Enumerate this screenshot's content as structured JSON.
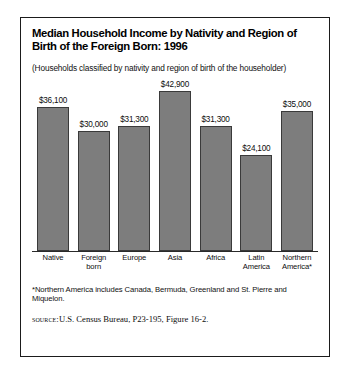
{
  "figure": {
    "title": "Median Household Income by Nativity and Region of Birth of the Foreign Born: 1996",
    "subtitle": "(Households classified by nativity and region of birth of the householder)",
    "footnote": "*Northern America includes Canada, Bermuda, Greenland and St. Pierre and Miquelon.",
    "source_label": "Source:",
    "source_text": "U.S. Census Bureau, P23-195, Figure 16-2.",
    "bar_color": "#7d7d7d",
    "bar_border_color": "#3a3a3a",
    "frame_color": "#1b1b1b"
  },
  "chart_data": {
    "type": "bar",
    "title": "Median Household Income by Nativity and Region of Birth of the Foreign Born: 1996",
    "subtitle": "(Households classified by nativity and region of birth of the householder)",
    "xlabel": "",
    "ylabel": "",
    "ylim": [
      0,
      42900
    ],
    "grid": false,
    "legend": "none",
    "categories": [
      "Native",
      "Foreign born",
      "Europe",
      "Asia",
      "Africa",
      "Latin America",
      "Northern America*"
    ],
    "values": [
      36100,
      30000,
      31300,
      42900,
      31300,
      24100,
      35000
    ],
    "data_labels": [
      "$36,100",
      "$30,000",
      "$31,300",
      "$42,900",
      "$31,300",
      "$24,100",
      "$35,000"
    ]
  },
  "bars": [
    {
      "label": "Native",
      "value": 36100,
      "value_label": "$36,100",
      "label_lines": "Native",
      "height_pct": 84.1
    },
    {
      "label": "Foreign born",
      "value": 30000,
      "value_label": "$30,000",
      "label_lines": "Foreign\nborn",
      "height_pct": 69.9
    },
    {
      "label": "Europe",
      "value": 31300,
      "value_label": "$31,300",
      "label_lines": "Europe",
      "height_pct": 72.9
    },
    {
      "label": "Asia",
      "value": 42900,
      "value_label": "$42,900",
      "label_lines": "Asia",
      "height_pct": 100.0
    },
    {
      "label": "Africa",
      "value": 31300,
      "value_label": "$31,300",
      "label_lines": "Africa",
      "height_pct": 72.9
    },
    {
      "label": "Latin America",
      "value": 24100,
      "value_label": "$24,100",
      "label_lines": "Latin\nAmerica",
      "height_pct": 56.2
    },
    {
      "label": "Northern America*",
      "value": 35000,
      "value_label": "$35,000",
      "label_lines": "Northern\nAmerica*",
      "height_pct": 81.6
    }
  ]
}
